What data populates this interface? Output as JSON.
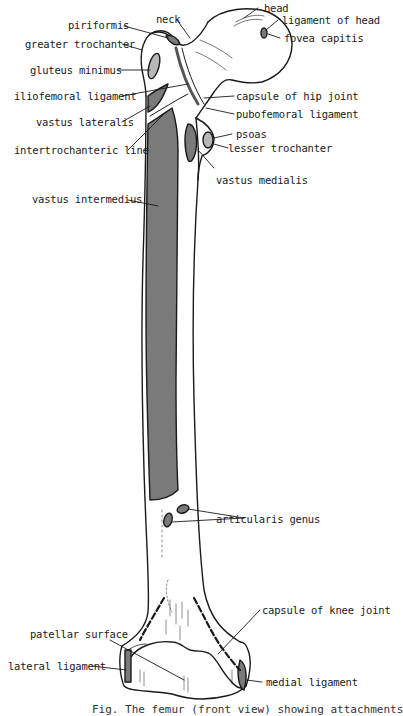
{
  "figure": {
    "colors": {
      "muscle_fill": "#7a7a7a",
      "light_fill": "#b8b8b8",
      "outline": "#1a1a1a",
      "bone": "#ffffff"
    },
    "labels": {
      "head": "head",
      "ligament_of_head": "ligament of head",
      "fovea_capitis": "fovea capitis",
      "neck": "neck",
      "piriformis": "piriformis",
      "greater_trochanter": "greater trochanter",
      "gluteus_minimus": "gluteus minimus",
      "iliofemoral_ligament": "iliofemoral ligament",
      "capsule_of_hip_joint": "capsule of hip joint",
      "vastus_lateralis": "vastus lateralis",
      "pubofemoral_ligament": "pubofemoral ligament",
      "psoas": "psoas",
      "intertrochanteric_line": "intertrochanteric line",
      "lesser_trochanter": "lesser trochanter",
      "vastus_medialis": "vastus medialis",
      "vastus_intermedius": "vastus intermedius",
      "articularis_genus": "articularis genus",
      "capsule_of_knee_joint": "capsule of knee joint",
      "patellar_surface": "patellar surface",
      "lateral_ligament": "lateral ligament",
      "medial_ligament": "medial ligament"
    },
    "caption": "Fig.  The femur (front view) showing attachments"
  }
}
